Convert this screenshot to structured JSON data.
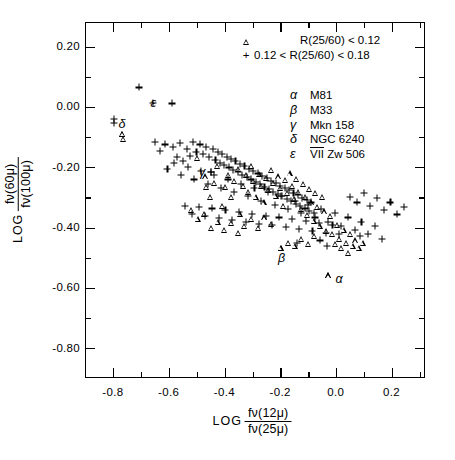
{
  "figure": {
    "axes": {
      "x": {
        "title_log": "LOG",
        "numerator": "fν(12μ)",
        "denominator": "fν(25μ)",
        "ticks": [
          "-0.8",
          "-0.6",
          "-0.4",
          "-0.2",
          "0.0",
          "0.2"
        ],
        "tick_values": [
          -0.8,
          -0.6,
          -0.4,
          -0.2,
          0.0,
          0.2
        ],
        "min": -0.9,
        "max": 0.32
      },
      "y": {
        "title_log": "LOG",
        "numerator": "fν(60μ)",
        "denominator": "fν(100μ)",
        "ticks": [
          "0.20",
          "0.00",
          "-0.20",
          "-0.40",
          "-0.60",
          "-0.80"
        ],
        "tick_values": [
          0.2,
          0.0,
          -0.2,
          -0.4,
          -0.6,
          -0.8
        ],
        "min": -0.9,
        "max": 0.28
      }
    },
    "symbol_legend": [
      {
        "symbol": "triangle",
        "label": "R(25/60) < 0.12"
      },
      {
        "symbol": "plus",
        "label": "0.12 < R(25/60) < 0.18"
      }
    ],
    "object_legend": [
      {
        "greek": "α",
        "name": "M81",
        "overline": ""
      },
      {
        "greek": "β",
        "name": "M33",
        "overline": ""
      },
      {
        "greek": "γ",
        "name": "Mkn 158",
        "overline": ""
      },
      {
        "greek": "δ",
        "name": "NGC 6240",
        "overline": ""
      },
      {
        "greek": "ε",
        "name": "Zw 506",
        "overline": "VII"
      }
    ],
    "labeled_points": [
      {
        "greek": "α",
        "x": -0.028,
        "y": -0.56,
        "symbol": "triangle",
        "label_dx": 11,
        "label_dy": 4
      },
      {
        "greek": "β",
        "x": -0.198,
        "y": -0.47,
        "symbol": "triangle",
        "label_dx": 1,
        "label_dy": 10
      },
      {
        "greek": "γ",
        "x": -0.447,
        "y": -0.218,
        "symbol": "plus",
        "label_dx": -9,
        "label_dy": 0
      },
      {
        "greek": "δ",
        "x": -0.767,
        "y": -0.092,
        "symbol": "triangle",
        "label_dx": 0,
        "label_dy": -10
      },
      {
        "greek": "ε",
        "x": -0.655,
        "y": 0.012,
        "symbol": "none",
        "label_dx": 0,
        "label_dy": 0
      }
    ]
  },
  "chart_data": {
    "type": "scatter",
    "title": "",
    "xlabel": "LOG fν(12μ)/fν(25μ)",
    "ylabel": "LOG fν(60μ)/fν(100μ)",
    "xlim": [
      -0.9,
      0.32
    ],
    "ylim": [
      -0.9,
      0.28
    ],
    "grid": false,
    "legend_position": "top-right",
    "series": [
      {
        "name": "R(25/60) < 0.12",
        "marker": "triangle",
        "points": [
          [
            -0.767,
            -0.092
          ],
          [
            -0.762,
            -0.108
          ],
          [
            -0.497,
            -0.17
          ],
          [
            -0.47,
            -0.232
          ],
          [
            -0.466,
            -0.268
          ],
          [
            -0.452,
            -0.3
          ],
          [
            -0.437,
            -0.252
          ],
          [
            -0.425,
            -0.196
          ],
          [
            -0.409,
            -0.33
          ],
          [
            -0.398,
            -0.268
          ],
          [
            -0.388,
            -0.228
          ],
          [
            -0.375,
            -0.3
          ],
          [
            -0.366,
            -0.246
          ],
          [
            -0.352,
            -0.208
          ],
          [
            -0.345,
            -0.356
          ],
          [
            -0.333,
            -0.262
          ],
          [
            -0.322,
            -0.226
          ],
          [
            -0.314,
            -0.284
          ],
          [
            -0.305,
            -0.196
          ],
          [
            -0.297,
            -0.248
          ],
          [
            -0.288,
            -0.3
          ],
          [
            -0.277,
            -0.224
          ],
          [
            -0.268,
            -0.262
          ],
          [
            -0.259,
            -0.318
          ],
          [
            -0.25,
            -0.236
          ],
          [
            -0.242,
            -0.276
          ],
          [
            -0.233,
            -0.21
          ],
          [
            -0.224,
            -0.252
          ],
          [
            -0.216,
            -0.296
          ],
          [
            -0.208,
            -0.232
          ],
          [
            -0.199,
            -0.27
          ],
          [
            -0.19,
            -0.33
          ],
          [
            -0.182,
            -0.244
          ],
          [
            -0.175,
            -0.288
          ],
          [
            -0.166,
            -0.222
          ],
          [
            -0.158,
            -0.262
          ],
          [
            -0.15,
            -0.306
          ],
          [
            -0.142,
            -0.24
          ],
          [
            -0.134,
            -0.282
          ],
          [
            -0.126,
            -0.34
          ],
          [
            -0.118,
            -0.256
          ],
          [
            -0.11,
            -0.3
          ],
          [
            -0.102,
            -0.36
          ],
          [
            -0.095,
            -0.272
          ],
          [
            -0.088,
            -0.318
          ],
          [
            -0.08,
            -0.38
          ],
          [
            -0.073,
            -0.286
          ],
          [
            -0.066,
            -0.332
          ],
          [
            -0.058,
            -0.396
          ],
          [
            -0.05,
            -0.3
          ],
          [
            -0.043,
            -0.348
          ],
          [
            -0.036,
            -0.414
          ],
          [
            -0.028,
            -0.56
          ],
          [
            -0.198,
            -0.47
          ],
          [
            -0.172,
            -0.452
          ],
          [
            -0.148,
            -0.462
          ],
          [
            -0.124,
            -0.44
          ],
          [
            -0.1,
            -0.455
          ],
          [
            -0.078,
            -0.43
          ],
          [
            -0.02,
            -0.364
          ],
          [
            -0.012,
            -0.424
          ],
          [
            -0.004,
            -0.456
          ],
          [
            0.004,
            -0.392
          ],
          [
            0.012,
            -0.44
          ],
          [
            0.02,
            -0.47
          ],
          [
            0.028,
            -0.408
          ],
          [
            0.036,
            -0.452
          ],
          [
            0.044,
            -0.486
          ],
          [
            0.052,
            -0.424
          ],
          [
            0.06,
            -0.462
          ],
          [
            0.07,
            -0.444
          ],
          [
            0.082,
            -0.47
          ],
          [
            0.096,
            -0.452
          ],
          [
            -0.232,
            -0.39
          ],
          [
            -0.256,
            -0.368
          ],
          [
            -0.28,
            -0.402
          ],
          [
            -0.304,
            -0.372
          ],
          [
            -0.328,
            -0.396
          ],
          [
            -0.352,
            -0.418
          ],
          [
            -0.376,
            -0.386
          ],
          [
            -0.4,
            -0.41
          ],
          [
            -0.424,
            -0.382
          ],
          [
            -0.448,
            -0.404
          ],
          [
            -0.472,
            -0.356
          ],
          [
            -0.496,
            -0.372
          ],
          [
            -0.52,
            -0.344
          ]
        ]
      },
      {
        "name": "0.12 < R(25/60) < 0.18",
        "marker": "plus",
        "points": [
          [
            -0.706,
            0.063
          ],
          [
            -0.655,
            0.012
          ],
          [
            -0.588,
            0.01
          ],
          [
            -0.797,
            -0.04
          ],
          [
            -0.795,
            -0.055
          ],
          [
            -0.614,
            -0.126
          ],
          [
            -0.586,
            -0.134
          ],
          [
            -0.56,
            -0.12
          ],
          [
            -0.534,
            -0.142
          ],
          [
            -0.512,
            -0.118
          ],
          [
            -0.5,
            -0.15
          ],
          [
            -0.488,
            -0.126
          ],
          [
            -0.476,
            -0.158
          ],
          [
            -0.466,
            -0.134
          ],
          [
            -0.456,
            -0.166
          ],
          [
            -0.447,
            -0.218
          ],
          [
            -0.44,
            -0.142
          ],
          [
            -0.432,
            -0.178
          ],
          [
            -0.424,
            -0.15
          ],
          [
            -0.416,
            -0.186
          ],
          [
            -0.408,
            -0.158
          ],
          [
            -0.4,
            -0.194
          ],
          [
            -0.392,
            -0.166
          ],
          [
            -0.384,
            -0.202
          ],
          [
            -0.376,
            -0.174
          ],
          [
            -0.368,
            -0.21
          ],
          [
            -0.36,
            -0.182
          ],
          [
            -0.352,
            -0.218
          ],
          [
            -0.344,
            -0.19
          ],
          [
            -0.336,
            -0.226
          ],
          [
            -0.328,
            -0.198
          ],
          [
            -0.32,
            -0.234
          ],
          [
            -0.312,
            -0.206
          ],
          [
            -0.304,
            -0.242
          ],
          [
            -0.296,
            -0.214
          ],
          [
            -0.288,
            -0.25
          ],
          [
            -0.28,
            -0.222
          ],
          [
            -0.272,
            -0.258
          ],
          [
            -0.264,
            -0.23
          ],
          [
            -0.256,
            -0.266
          ],
          [
            -0.248,
            -0.238
          ],
          [
            -0.24,
            -0.274
          ],
          [
            -0.232,
            -0.246
          ],
          [
            -0.224,
            -0.282
          ],
          [
            -0.216,
            -0.254
          ],
          [
            -0.208,
            -0.29
          ],
          [
            -0.2,
            -0.262
          ],
          [
            -0.192,
            -0.298
          ],
          [
            -0.184,
            -0.27
          ],
          [
            -0.176,
            -0.306
          ],
          [
            -0.168,
            -0.278
          ],
          [
            -0.16,
            -0.314
          ],
          [
            -0.152,
            -0.286
          ],
          [
            -0.144,
            -0.322
          ],
          [
            -0.136,
            -0.294
          ],
          [
            -0.128,
            -0.33
          ],
          [
            -0.12,
            -0.302
          ],
          [
            -0.112,
            -0.338
          ],
          [
            -0.104,
            -0.31
          ],
          [
            -0.096,
            -0.346
          ],
          [
            -0.088,
            -0.318
          ],
          [
            -0.08,
            -0.354
          ],
          [
            -0.604,
            -0.208
          ],
          [
            -0.58,
            -0.186
          ],
          [
            -0.556,
            -0.228
          ],
          [
            -0.532,
            -0.2
          ],
          [
            -0.508,
            -0.242
          ],
          [
            -0.484,
            -0.214
          ],
          [
            -0.46,
            -0.256
          ],
          [
            -0.436,
            -0.228
          ],
          [
            -0.412,
            -0.27
          ],
          [
            -0.388,
            -0.242
          ],
          [
            -0.364,
            -0.284
          ],
          [
            -0.34,
            -0.256
          ],
          [
            -0.316,
            -0.298
          ],
          [
            -0.292,
            -0.27
          ],
          [
            -0.268,
            -0.312
          ],
          [
            -0.244,
            -0.284
          ],
          [
            -0.22,
            -0.326
          ],
          [
            -0.196,
            -0.298
          ],
          [
            -0.172,
            -0.34
          ],
          [
            -0.148,
            -0.312
          ],
          [
            -0.124,
            -0.354
          ],
          [
            -0.1,
            -0.326
          ],
          [
            -0.076,
            -0.368
          ],
          [
            -0.052,
            -0.34
          ],
          [
            -0.028,
            -0.382
          ],
          [
            -0.004,
            -0.354
          ],
          [
            0.02,
            -0.396
          ],
          [
            0.044,
            -0.368
          ],
          [
            0.068,
            -0.41
          ],
          [
            0.092,
            -0.382
          ],
          [
            0.116,
            -0.424
          ],
          [
            0.14,
            -0.396
          ],
          [
            0.164,
            -0.438
          ],
          [
            0.052,
            -0.3
          ],
          [
            0.076,
            -0.318
          ],
          [
            0.1,
            -0.286
          ],
          [
            0.124,
            -0.33
          ],
          [
            0.148,
            -0.304
          ],
          [
            0.172,
            -0.344
          ],
          [
            0.196,
            -0.318
          ],
          [
            0.22,
            -0.358
          ],
          [
            0.244,
            -0.332
          ],
          [
            -0.54,
            -0.33
          ],
          [
            -0.516,
            -0.356
          ],
          [
            -0.492,
            -0.332
          ],
          [
            -0.468,
            -0.364
          ],
          [
            -0.444,
            -0.338
          ],
          [
            -0.42,
            -0.37
          ],
          [
            -0.396,
            -0.344
          ],
          [
            -0.372,
            -0.376
          ],
          [
            -0.348,
            -0.35
          ],
          [
            -0.324,
            -0.382
          ],
          [
            -0.3,
            -0.356
          ],
          [
            -0.276,
            -0.388
          ],
          [
            -0.252,
            -0.362
          ],
          [
            -0.228,
            -0.394
          ],
          [
            -0.204,
            -0.368
          ],
          [
            -0.18,
            -0.4
          ],
          [
            -0.156,
            -0.374
          ],
          [
            -0.132,
            -0.406
          ],
          [
            -0.108,
            -0.38
          ],
          [
            -0.084,
            -0.412
          ],
          [
            -0.06,
            -0.386
          ],
          [
            -0.036,
            -0.418
          ],
          [
            -0.012,
            -0.392
          ],
          [
            0.012,
            -0.424
          ],
          [
            -0.65,
            -0.118
          ],
          [
            -0.632,
            -0.148
          ],
          [
            -0.57,
            -0.168
          ],
          [
            -0.548,
            -0.18
          ],
          [
            -0.524,
            -0.164
          ],
          [
            -0.14,
            -0.452
          ],
          [
            -0.056,
            -0.444
          ],
          [
            -0.032,
            -0.462
          ],
          [
            0.088,
            -0.428
          ]
        ]
      }
    ]
  }
}
